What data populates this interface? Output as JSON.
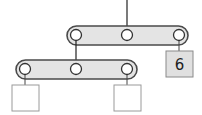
{
  "diagram": {
    "type": "tree",
    "colors": {
      "node_fill": "#e4e4e4",
      "node_stroke": "#4a4a4a",
      "pointer_fill": "#ffffff",
      "edge": "#222222",
      "leaf_fill": "#ffffff",
      "leaf_stroke": "#9a9a9a",
      "filled_leaf_fill": "#e0e0e0"
    },
    "nodes": [
      {
        "id": "root",
        "pointers": 3
      },
      {
        "id": "left-child",
        "pointers": 3
      }
    ],
    "leaves": [
      {
        "id": "leaf-1",
        "label": ""
      },
      {
        "id": "leaf-2",
        "label": ""
      },
      {
        "id": "leaf-3",
        "label": "6"
      }
    ]
  }
}
